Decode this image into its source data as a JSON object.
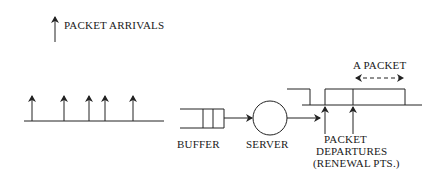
{
  "legend": {
    "label": "PACKET ARRIVALS",
    "icon": "up-arrow-icon"
  },
  "arrivals": {
    "positions_x": [
      32,
      64,
      89,
      105,
      133
    ],
    "axis": {
      "x1": 24,
      "x2": 164,
      "y": 121
    }
  },
  "queue": {
    "buffer_label": "BUFFER",
    "server_label": "SERVER"
  },
  "departures": {
    "label_lines": [
      "PACKET",
      "DEPARTURES",
      "(RENEWAL PTS.)"
    ],
    "positions_x": [
      325,
      353
    ],
    "packet_label": "A PACKET"
  },
  "colors": {
    "line": "#222222",
    "text": "#1a1a1a",
    "background": "#ffffff"
  }
}
